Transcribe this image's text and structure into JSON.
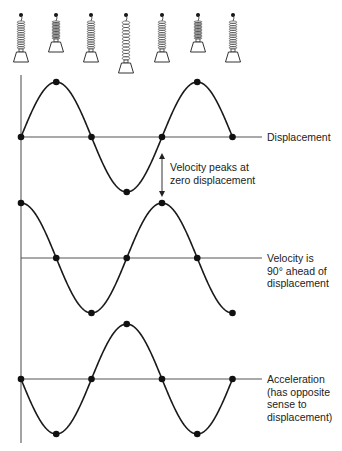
{
  "springs": {
    "positions_x": [
      21,
      56,
      91,
      126,
      162,
      198,
      233
    ],
    "states": [
      "rest",
      "compressed",
      "rest",
      "extended",
      "rest",
      "compressed",
      "rest"
    ]
  },
  "graphs": [
    {
      "id": "displacement",
      "label": "Displacement",
      "baseline_y": 137,
      "amplitude": 55,
      "phase": "sin",
      "points": [
        "zero",
        "max",
        "zero",
        "min",
        "zero",
        "max",
        "zero"
      ]
    },
    {
      "id": "velocity",
      "label": "Velocity is\n90° ahead of\ndisplacement",
      "baseline_y": 258,
      "amplitude": 55,
      "phase": "cos",
      "points": [
        "max",
        "zero",
        "min",
        "zero",
        "max",
        "zero",
        "min"
      ]
    },
    {
      "id": "acceleration",
      "label": "Acceleration\n(has opposite\nsense to\ndisplacement)",
      "baseline_y": 379,
      "amplitude": 55,
      "phase": "-sin",
      "points": [
        "zero",
        "min",
        "zero",
        "max",
        "zero",
        "min",
        "zero"
      ]
    }
  ],
  "annotation": {
    "text": "Velocity peaks at\nzero displacement",
    "arrow_x": 162,
    "arrow_y1": 153,
    "arrow_y2": 197
  },
  "axis": {
    "x": 21,
    "y_top": 75,
    "y_bottom": 443,
    "x_end": 262
  },
  "wave": {
    "x_start": 21,
    "period_px": 141,
    "cycles": 1.5
  },
  "colors": {
    "curve": "#1a1a1a",
    "axis": "#666666",
    "baseline": "#555555",
    "text": "#222222",
    "dot": "#111111"
  }
}
